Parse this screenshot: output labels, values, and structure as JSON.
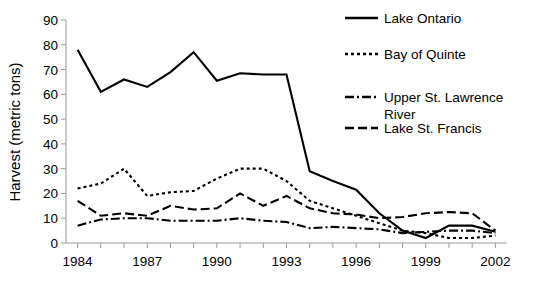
{
  "chart_data": {
    "type": "line",
    "title": "",
    "xlabel": "",
    "ylabel": "Harvest (metric tons)",
    "x": [
      1984,
      1985,
      1986,
      1987,
      1988,
      1989,
      1990,
      1991,
      1992,
      1993,
      1994,
      1995,
      1996,
      1997,
      1998,
      1999,
      2000,
      2001,
      2002
    ],
    "xlim": [
      1983.5,
      2002.5
    ],
    "ylim": [
      0,
      90
    ],
    "yticks": [
      0,
      10,
      20,
      30,
      40,
      50,
      60,
      70,
      80,
      90
    ],
    "xticks_labeled": [
      1984,
      1987,
      1990,
      1993,
      1996,
      1999,
      2002
    ],
    "xtick_labels": [
      "1984",
      "1987",
      "1990",
      "1993",
      "1996",
      "1999",
      "2002"
    ],
    "ytick_labels": [
      "0",
      "10",
      "20",
      "30",
      "40",
      "50",
      "60",
      "70",
      "80",
      "90"
    ],
    "grid": false,
    "legend_position": "top-right",
    "series": [
      {
        "name": "Lake Ontario",
        "style": "solid",
        "dasharray": "",
        "values": [
          78,
          61,
          66,
          63,
          69,
          77,
          65.5,
          68.5,
          68,
          68,
          29,
          25,
          21.5,
          12,
          5,
          2,
          7,
          7,
          4.5
        ]
      },
      {
        "name": "Bay of Quinte",
        "style": "dotted",
        "dasharray": "3,3",
        "values": [
          22,
          24,
          30,
          19,
          20.5,
          21,
          26,
          30,
          30,
          25,
          17,
          14,
          11,
          8,
          5,
          4,
          2,
          2,
          3
        ]
      },
      {
        "name": "Upper St. Lawrence River",
        "style": "dashdot",
        "dasharray": "9,3,2,3",
        "values": [
          7,
          9.5,
          10,
          10,
          9,
          9,
          9,
          10,
          9,
          8.5,
          6,
          6.5,
          6,
          5.5,
          4,
          4.5,
          5,
          5,
          4
        ]
      },
      {
        "name": "Lake St. Francis",
        "style": "dashed",
        "dasharray": "9,4",
        "values": [
          17,
          11,
          12,
          11,
          15,
          13.5,
          14,
          20,
          15,
          19,
          14,
          12,
          11.5,
          10,
          10.5,
          12,
          12.5,
          12,
          5
        ]
      }
    ]
  }
}
